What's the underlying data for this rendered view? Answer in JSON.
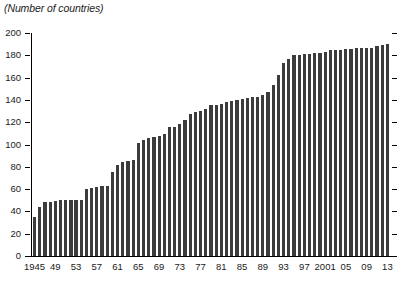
{
  "chart": {
    "title": "(Number of countries)",
    "axis_color": "#000000",
    "bar_color": "#3c3c3c",
    "background": "#ffffff"
  },
  "chart_data": {
    "type": "bar",
    "title": "(Number of countries)",
    "xlabel": "",
    "ylabel": "(Number of countries)",
    "ylim": [
      0,
      200
    ],
    "ytick_values": [
      0,
      20,
      40,
      60,
      80,
      100,
      120,
      140,
      160,
      180,
      200
    ],
    "ytick_labels": [
      "0",
      "20",
      "40",
      "60",
      "80",
      "100",
      "120",
      "140",
      "160",
      "180",
      "200"
    ],
    "xtick_labels": [
      "1945",
      "49",
      "53",
      "57",
      "61",
      "65",
      "69",
      "73",
      "77",
      "81",
      "85",
      "89",
      "93",
      "97",
      "2001",
      "05",
      "09",
      "13"
    ],
    "xtick_categories": [
      "1945",
      "1949",
      "1953",
      "1957",
      "1961",
      "1965",
      "1969",
      "1973",
      "1977",
      "1981",
      "1985",
      "1989",
      "1993",
      "1997",
      "2001",
      "2005",
      "2009",
      "2013"
    ],
    "grid": false,
    "legend": null,
    "categories": [
      "1945",
      "1946",
      "1947",
      "1948",
      "1949",
      "1950",
      "1951",
      "1952",
      "1953",
      "1954",
      "1955",
      "1956",
      "1957",
      "1958",
      "1959",
      "1960",
      "1961",
      "1962",
      "1963",
      "1964",
      "1965",
      "1966",
      "1967",
      "1968",
      "1969",
      "1970",
      "1971",
      "1972",
      "1973",
      "1974",
      "1975",
      "1976",
      "1977",
      "1978",
      "1979",
      "1980",
      "1981",
      "1982",
      "1983",
      "1984",
      "1985",
      "1986",
      "1987",
      "1988",
      "1989",
      "1990",
      "1991",
      "1992",
      "1993",
      "1994",
      "1995",
      "1996",
      "1997",
      "1998",
      "1999",
      "2000",
      "2001",
      "2002",
      "2003",
      "2004",
      "2005",
      "2006",
      "2007",
      "2008",
      "2009",
      "2010",
      "2011",
      "2012",
      "2013"
    ],
    "values": [
      35,
      44,
      48,
      48,
      49,
      50,
      50,
      50,
      50,
      50,
      60,
      61,
      62,
      63,
      63,
      75,
      82,
      84,
      85,
      86,
      101,
      104,
      106,
      107,
      108,
      109,
      116,
      116,
      118,
      122,
      127,
      129,
      130,
      132,
      135,
      135,
      136,
      138,
      139,
      140,
      141,
      142,
      143,
      143,
      144,
      147,
      153,
      162,
      173,
      177,
      180,
      180,
      181,
      181,
      182,
      182,
      183,
      185,
      185,
      185,
      186,
      186,
      187,
      187,
      187,
      187,
      188,
      189,
      190
    ]
  }
}
